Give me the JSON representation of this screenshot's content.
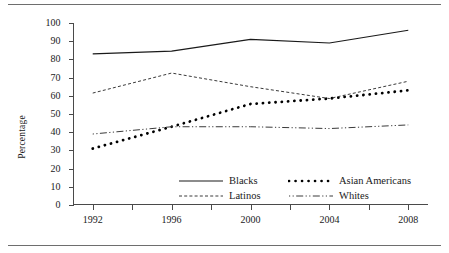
{
  "chart_data": {
    "type": "line",
    "title": "",
    "xlabel": "",
    "ylabel": "Percentage",
    "x": [
      1992,
      1996,
      2000,
      2004,
      2008
    ],
    "categories": [
      "1992",
      "1996",
      "2000",
      "2004",
      "2008"
    ],
    "xlim": [
      1991,
      2009
    ],
    "ylim": [
      0,
      100
    ],
    "ytick_values": [
      0,
      10,
      20,
      30,
      40,
      50,
      60,
      70,
      80,
      90,
      100
    ],
    "ytick_labels": [
      "0",
      "10",
      "20",
      "30",
      "40",
      "50",
      "60",
      "70",
      "80",
      "90",
      "100"
    ],
    "xtick_labels": [
      "1992",
      "1996",
      "2000",
      "2004",
      "2008"
    ],
    "grid": false,
    "legend_position": "inside lower-right",
    "series": [
      {
        "name": "Blacks",
        "style": "solid",
        "color": "#1a1a1a",
        "values": [
          83,
          84.5,
          91,
          89,
          96
        ]
      },
      {
        "name": "Asian Americans",
        "style": "dotted",
        "color": "#000000",
        "values": [
          31,
          43,
          55.5,
          58.5,
          63
        ]
      },
      {
        "name": "Latinos",
        "style": "dashed",
        "color": "#3a3a3a",
        "values": [
          61.5,
          72.5,
          65,
          58.5,
          68
        ]
      },
      {
        "name": "Whites",
        "style": "dash-dot",
        "color": "#3a3a3a",
        "values": [
          39,
          43,
          43,
          42,
          44
        ]
      }
    ]
  },
  "legend": {
    "row1_item1": "Blacks",
    "row1_item2": "Asian Americans",
    "row2_item1": "Latinos",
    "row2_item2": "Whites"
  },
  "axis": {
    "y_title": "Percentage"
  }
}
